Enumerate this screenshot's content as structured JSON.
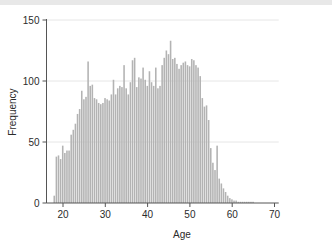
{
  "chart_data": {
    "type": "bar",
    "title": "",
    "subtitle": "",
    "xlabel": "Age",
    "ylabel": "Frequency",
    "xlim": [
      17,
      71
    ],
    "ylim": [
      0,
      152
    ],
    "xticks": [
      20,
      30,
      40,
      50,
      60,
      70
    ],
    "yticks": [
      0,
      50,
      100,
      150
    ],
    "grid": true,
    "grid_axis": "y",
    "legend": null,
    "bar_color": "#b3b3b3",
    "bar_edge_color": "#ffffff",
    "axis_color": "#555555",
    "text_color": "#2b2b2b",
    "grid_color": "#e6e6e6",
    "bin_width": 0.5,
    "categories": [
      18.0,
      18.5,
      19.0,
      19.5,
      20.0,
      20.5,
      21.0,
      21.5,
      22.0,
      22.5,
      23.0,
      23.5,
      24.0,
      24.5,
      25.0,
      25.5,
      26.0,
      26.5,
      27.0,
      27.5,
      28.0,
      28.5,
      29.0,
      29.5,
      30.0,
      30.5,
      31.0,
      31.5,
      32.0,
      32.5,
      33.0,
      33.5,
      34.0,
      34.5,
      35.0,
      35.5,
      36.0,
      36.5,
      37.0,
      37.5,
      38.0,
      38.5,
      39.0,
      39.5,
      40.0,
      40.5,
      41.0,
      41.5,
      42.0,
      42.5,
      43.0,
      43.5,
      44.0,
      44.5,
      45.0,
      45.5,
      46.0,
      46.5,
      47.0,
      47.5,
      48.0,
      48.5,
      49.0,
      49.5,
      50.0,
      50.5,
      51.0,
      51.5,
      52.0,
      52.5,
      53.0,
      53.5,
      54.0,
      54.5,
      55.0,
      55.5,
      56.0,
      56.5,
      57.0,
      57.5,
      58.0,
      58.5,
      59.0,
      59.5,
      60.0,
      60.5,
      61.0,
      61.5,
      62.0,
      62.5,
      63.0,
      63.5,
      64.0,
      64.5,
      65.0
    ],
    "values": [
      6,
      38,
      39,
      36,
      47,
      41,
      43,
      43,
      56,
      60,
      65,
      73,
      77,
      92,
      85,
      87,
      116,
      96,
      97,
      86,
      85,
      82,
      81,
      82,
      86,
      85,
      84,
      89,
      101,
      89,
      94,
      96,
      95,
      113,
      94,
      89,
      99,
      117,
      119,
      95,
      103,
      102,
      111,
      101,
      96,
      108,
      99,
      96,
      111,
      94,
      96,
      113,
      119,
      125,
      122,
      133,
      118,
      119,
      114,
      110,
      113,
      115,
      116,
      113,
      112,
      118,
      117,
      113,
      111,
      104,
      86,
      79,
      80,
      68,
      45,
      33,
      27,
      47,
      20,
      16,
      12,
      9,
      6,
      4,
      3,
      2,
      2,
      1,
      1,
      1,
      1,
      1,
      1,
      1,
      1
    ],
    "annotations": []
  },
  "axes": {
    "ylabel": "Frequency",
    "xlabel": "Age"
  }
}
